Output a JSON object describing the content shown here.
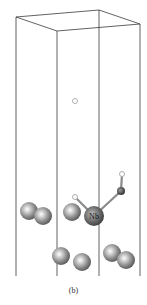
{
  "figure": {
    "caption": "(b)",
    "element_label": "Nb",
    "colors": {
      "cell_edge": "#3a3a3a",
      "atom_gray": "#8a8a8a",
      "atom_nb": "#6e6e6e",
      "atom_o": "#555555",
      "atom_h": "#b0b0b0"
    },
    "cell": {
      "top": [
        [
          16,
          17
        ],
        [
          99,
          10
        ],
        [
          140,
          24
        ],
        [
          57,
          31
        ]
      ],
      "verticals_x": [
        16,
        57,
        99,
        140
      ],
      "bottom_y": 276
    },
    "atoms": [
      {
        "type": "gray",
        "x": 29,
        "y": 211,
        "r": 9
      },
      {
        "type": "gray",
        "x": 43,
        "y": 216,
        "r": 9
      },
      {
        "type": "gray",
        "x": 72,
        "y": 212,
        "r": 9
      },
      {
        "type": "nb",
        "x": 94,
        "y": 216,
        "r": 10,
        "label": "Nb"
      },
      {
        "type": "gray",
        "x": 61,
        "y": 256,
        "r": 9
      },
      {
        "type": "gray",
        "x": 82,
        "y": 262,
        "r": 9
      },
      {
        "type": "gray",
        "x": 112,
        "y": 253,
        "r": 9
      },
      {
        "type": "gray",
        "x": 126,
        "y": 260,
        "r": 9
      },
      {
        "type": "o",
        "x": 121,
        "y": 191,
        "r": 4
      },
      {
        "type": "h",
        "x": 122,
        "y": 174,
        "r": 2.5
      },
      {
        "type": "h",
        "x": 75,
        "y": 197,
        "r": 2.5
      },
      {
        "type": "h",
        "x": 75,
        "y": 101,
        "r": 2.5
      }
    ],
    "bonds": [
      [
        94,
        216,
        121,
        191
      ],
      [
        121,
        191,
        122,
        174
      ],
      [
        94,
        216,
        75,
        197
      ]
    ]
  }
}
